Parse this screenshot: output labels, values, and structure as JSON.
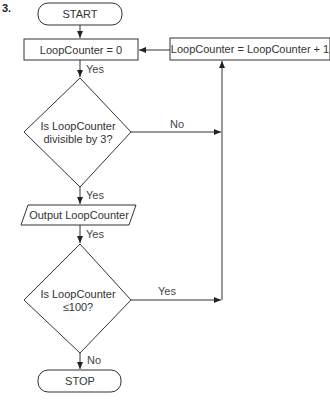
{
  "figure": {
    "number": "3."
  },
  "nodes": {
    "start": {
      "label": "START",
      "type": "terminator"
    },
    "init": {
      "label": "LoopCounter = 0",
      "type": "process"
    },
    "increment": {
      "label": "LoopCounter = LoopCounter + 1",
      "type": "process"
    },
    "decision1": {
      "line1": "Is LoopCounter",
      "line2": "divisible by 3?",
      "type": "decision"
    },
    "output": {
      "label": "Output LoopCounter",
      "type": "io"
    },
    "decision2": {
      "line1": "Is LoopCounter",
      "line2": "≤100?",
      "type": "decision"
    },
    "stop": {
      "label": "STOP",
      "type": "terminator"
    }
  },
  "edges": {
    "init_to_d1": "Yes",
    "d1_no": "No",
    "d1_yes": "Yes",
    "output_to_d2": "Yes",
    "d2_yes": "Yes",
    "d2_no": "No"
  },
  "colors": {
    "stroke": "#333333",
    "background": "#ffffff"
  }
}
